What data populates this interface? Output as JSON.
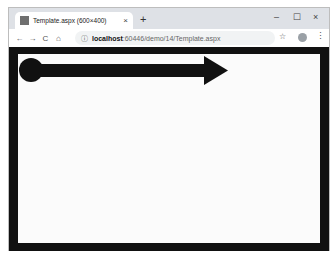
{
  "browser": {
    "tab": {
      "title": "Template.aspx (600×400)",
      "close_glyph": "×"
    },
    "new_tab_glyph": "+",
    "window_controls": {
      "minimize": "–",
      "maximize": "☐",
      "close": "×"
    },
    "nav": {
      "back": "←",
      "forward": "→",
      "reload": "C",
      "home": "⌂"
    },
    "address": {
      "icon": "ⓘ",
      "host": "localhost",
      "rest": ":60446/demo/14/Template.aspx"
    },
    "bookmark_glyph": "☆",
    "menu_glyph": "⋮"
  },
  "page": {
    "border_color": "#111111",
    "canvas_color": "#fbfbfb",
    "shape": {
      "type": "arrow-with-circle-tail",
      "color": "#111111"
    }
  }
}
